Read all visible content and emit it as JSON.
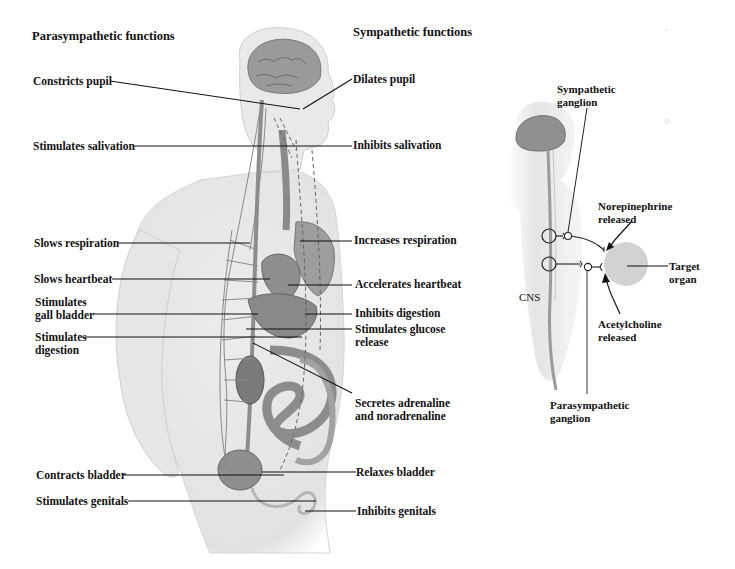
{
  "headers": {
    "parasympathetic": "Parasympathetic functions",
    "sympathetic": "Sympathetic functions"
  },
  "parasympathetic_labels": [
    {
      "line1": "Constricts pupil"
    },
    {
      "line1": "Stimulates salivation"
    },
    {
      "line1": "Slows respiration"
    },
    {
      "line1": "Slows heartbeat"
    },
    {
      "line1": "Stimulates",
      "line2": "gall bladder"
    },
    {
      "line1": "Stimulates",
      "line2": "digestion"
    },
    {
      "line1": "Contracts bladder"
    },
    {
      "line1": "Stimulates genitals"
    }
  ],
  "sympathetic_labels": [
    {
      "line1": "Dilates pupil"
    },
    {
      "line1": "Inhibits salivation"
    },
    {
      "line1": "Increases respiration"
    },
    {
      "line1": "Accelerates heartbeat"
    },
    {
      "line1": "Inhibits digestion"
    },
    {
      "line1": "Stimulates glucose",
      "line2": "release"
    },
    {
      "line1": "Secretes adrenaline",
      "line2": "and noradrenaline"
    },
    {
      "line1": "Relaxes bladder"
    },
    {
      "line1": "Inhibits genitals"
    }
  ],
  "inset": {
    "sympathetic_ganglion": {
      "line1": "Sympathetic",
      "line2": "ganglion"
    },
    "norepinephrine": {
      "line1": "Norepinephrine",
      "line2": "released"
    },
    "target_organ": {
      "line1": "Target",
      "line2": "organ"
    },
    "cns": "CNS",
    "acetylcholine": {
      "line1": "Acetylcholine",
      "line2": "released"
    },
    "parasympathetic_ganglion": {
      "line1": "Parasympathetic",
      "line2": "ganglion"
    }
  },
  "colors": {
    "body_fill": "#e8e8e8",
    "organ_fill": "#8a8a8a",
    "nerve": "#777777",
    "target_organ": "#d4d4d4",
    "label_line": "#111111"
  }
}
